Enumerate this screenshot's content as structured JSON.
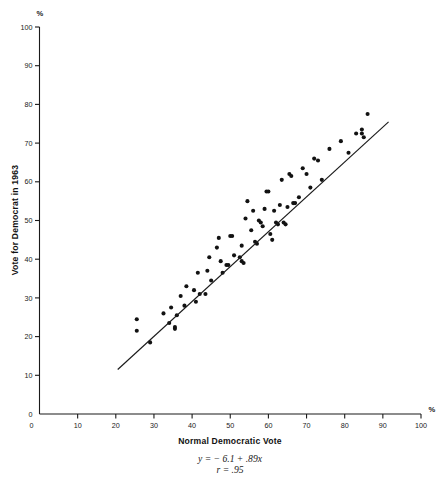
{
  "chart_data": {
    "type": "scatter",
    "title": "",
    "xlabel": "Normal Democratic Vote",
    "ylabel": "Vote for Democrat in 1963",
    "x_unit_label": "%",
    "y_unit_label": "%",
    "xlim": [
      0,
      100
    ],
    "ylim": [
      0,
      100
    ],
    "grid": false,
    "legend": "none",
    "xticks": [
      0,
      10,
      20,
      30,
      40,
      50,
      60,
      70,
      80,
      90,
      100
    ],
    "yticks": [
      0,
      10,
      20,
      30,
      40,
      50,
      60,
      70,
      80,
      90,
      100
    ],
    "xtick_labels": [
      "0",
      "10",
      "20",
      "30",
      "40",
      "50",
      "60",
      "70",
      "80",
      "90",
      "100"
    ],
    "ytick_labels": [
      "0",
      "10",
      "20",
      "30",
      "40",
      "50",
      "60",
      "70",
      "80",
      "90",
      "100"
    ],
    "annotations": [
      "y = − 6.1 + .89x",
      "r = .95"
    ],
    "regression": {
      "equation": "y = − 6.1 + .89x",
      "correlation": "r = .95",
      "slope": 0.89,
      "intercept": -6.1,
      "r": 0.95,
      "x_start": 20.5,
      "x_end": 91.5,
      "y_start": 11.5,
      "y_end": 75.5
    },
    "series": [
      {
        "name": "states",
        "marker": "filled-circle",
        "color": "#121212",
        "points": [
          [
            25.5,
            24.5
          ],
          [
            25.5,
            21.5
          ],
          [
            29.0,
            18.5
          ],
          [
            32.5,
            26.0
          ],
          [
            34.0,
            23.5
          ],
          [
            34.5,
            27.5
          ],
          [
            35.5,
            22.0
          ],
          [
            35.5,
            22.5
          ],
          [
            36.0,
            25.5
          ],
          [
            37.0,
            30.5
          ],
          [
            38.0,
            28.0
          ],
          [
            38.5,
            33.0
          ],
          [
            40.5,
            32.0
          ],
          [
            41.0,
            29.0
          ],
          [
            41.5,
            36.5
          ],
          [
            42.0,
            31.0
          ],
          [
            43.5,
            31.0
          ],
          [
            44.0,
            37.0
          ],
          [
            44.5,
            40.5
          ],
          [
            45.0,
            34.5
          ],
          [
            46.5,
            43.0
          ],
          [
            47.0,
            45.5
          ],
          [
            47.5,
            39.5
          ],
          [
            48.0,
            36.5
          ],
          [
            49.0,
            38.5
          ],
          [
            49.5,
            38.5
          ],
          [
            50.0,
            46.0
          ],
          [
            50.5,
            46.0
          ],
          [
            51.0,
            41.0
          ],
          [
            52.5,
            40.5
          ],
          [
            53.0,
            43.5
          ],
          [
            53.0,
            39.5
          ],
          [
            53.5,
            39.0
          ],
          [
            54.0,
            50.5
          ],
          [
            54.5,
            55.0
          ],
          [
            55.5,
            47.5
          ],
          [
            56.0,
            52.5
          ],
          [
            56.5,
            44.5
          ],
          [
            57.0,
            44.0
          ],
          [
            57.5,
            50.0
          ],
          [
            58.0,
            49.5
          ],
          [
            58.5,
            48.5
          ],
          [
            59.0,
            53.0
          ],
          [
            59.5,
            57.5
          ],
          [
            60.0,
            57.5
          ],
          [
            60.5,
            46.5
          ],
          [
            61.0,
            45.0
          ],
          [
            61.5,
            52.5
          ],
          [
            62.0,
            49.5
          ],
          [
            62.5,
            49.0
          ],
          [
            63.0,
            54.0
          ],
          [
            63.5,
            60.5
          ],
          [
            64.0,
            49.5
          ],
          [
            64.5,
            49.0
          ],
          [
            65.0,
            53.5
          ],
          [
            65.5,
            62.0
          ],
          [
            66.0,
            61.5
          ],
          [
            66.5,
            54.5
          ],
          [
            67.0,
            54.5
          ],
          [
            68.0,
            56.0
          ],
          [
            69.0,
            63.5
          ],
          [
            70.0,
            62.0
          ],
          [
            71.0,
            58.5
          ],
          [
            72.0,
            66.0
          ],
          [
            73.0,
            65.5
          ],
          [
            74.0,
            60.5
          ],
          [
            76.0,
            68.5
          ],
          [
            79.0,
            70.5
          ],
          [
            81.0,
            67.5
          ],
          [
            83.0,
            72.5
          ],
          [
            84.5,
            72.5
          ],
          [
            84.5,
            73.5
          ],
          [
            85.0,
            71.5
          ],
          [
            86.0,
            77.5
          ]
        ]
      }
    ]
  },
  "axis": {
    "y_title": "Vote for Democrat in 1963",
    "x_title": "Normal Democratic Vote",
    "y_pct": "%",
    "x_pct": "%"
  }
}
